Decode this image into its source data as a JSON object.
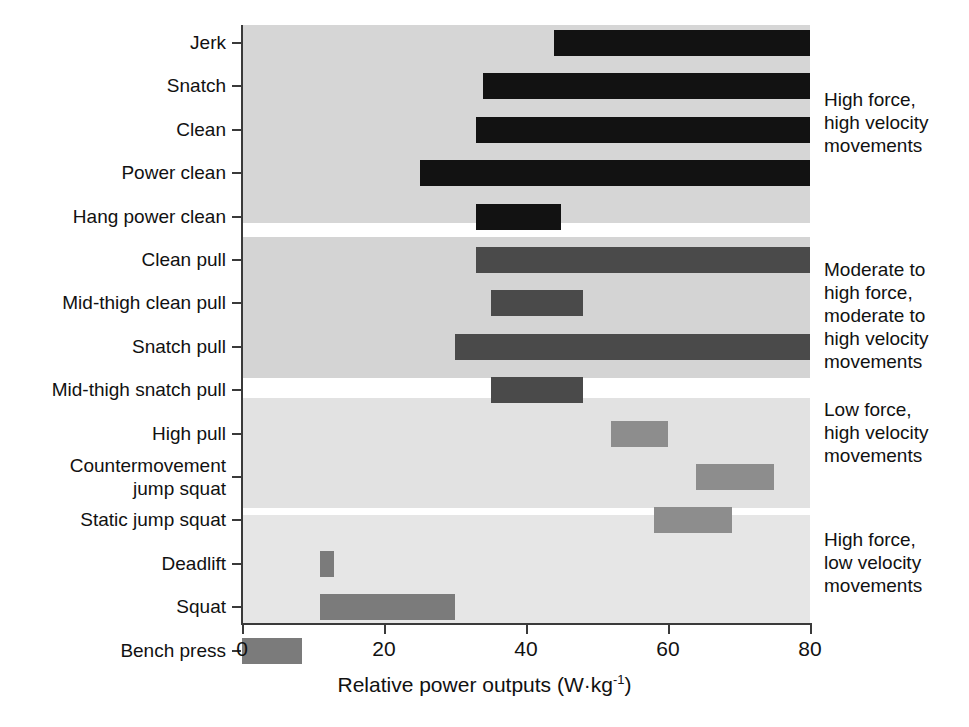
{
  "chart_data": {
    "type": "bar",
    "orientation": "horizontal",
    "title": "",
    "subtitle": "",
    "xlabel": "Relative power outputs (W·kg-1)",
    "xlabel_main": "Relative power outputs (W",
    "xlabel_middot": "·",
    "xlabel_kg": "kg",
    "xlabel_exp": "-1",
    "xlabel_close": ")",
    "ylabel": "",
    "xlim": [
      0,
      80
    ],
    "xticks": [
      0,
      20,
      40,
      60,
      80
    ],
    "xticklabels": [
      "0",
      "20",
      "40",
      "60",
      "80"
    ],
    "grid": false,
    "legend": "none",
    "value_units": "W·kg-1",
    "note": "Each bar is a floating range (start, end) of relative power output",
    "categories": [
      "Jerk",
      "Snatch",
      "Clean",
      "Power clean",
      "Hang power clean",
      "Clean pull",
      "Mid-thigh clean pull",
      "Snatch pull",
      "Mid-thigh snatch pull",
      "High pull",
      "Countermovement jump squat",
      "Static jump squat",
      "Deadlift",
      "Squat",
      "Bench press"
    ],
    "bars": [
      {
        "label": "Jerk",
        "start": 44,
        "end": 80,
        "group": 0,
        "color": "#121212"
      },
      {
        "label": "Snatch",
        "start": 34,
        "end": 80,
        "group": 0,
        "color": "#121212"
      },
      {
        "label": "Clean",
        "start": 33,
        "end": 80,
        "group": 0,
        "color": "#121212"
      },
      {
        "label": "Power clean",
        "start": 25,
        "end": 80,
        "group": 0,
        "color": "#121212"
      },
      {
        "label": "Hang power clean",
        "start": 33,
        "end": 45,
        "group": 0,
        "color": "#121212"
      },
      {
        "label": "Clean pull",
        "start": 33,
        "end": 80,
        "group": 1,
        "color": "#4a4a4a"
      },
      {
        "label": "Mid-thigh clean pull",
        "start": 35,
        "end": 48,
        "group": 1,
        "color": "#4a4a4a"
      },
      {
        "label": "Snatch pull",
        "start": 30,
        "end": 80,
        "group": 1,
        "color": "#4a4a4a"
      },
      {
        "label": "Mid-thigh snatch pull",
        "start": 35,
        "end": 48,
        "group": 1,
        "color": "#4a4a4a"
      },
      {
        "label": "High pull",
        "start": 52,
        "end": 60,
        "group": 2,
        "color": "#8d8d8d"
      },
      {
        "label": "Countermovement jump squat",
        "start": 64,
        "end": 75,
        "group": 2,
        "color": "#8d8d8d"
      },
      {
        "label": "Static jump squat",
        "start": 58,
        "end": 69,
        "group": 2,
        "color": "#8d8d8d"
      },
      {
        "label": "Deadlift",
        "start": 11,
        "end": 13,
        "group": 3,
        "color": "#7b7b7b"
      },
      {
        "label": "Squat",
        "start": 11,
        "end": 30,
        "group": 3,
        "color": "#7b7b7b"
      },
      {
        "label": "Bench press",
        "start": 0,
        "end": 8.5,
        "group": 3,
        "color": "#7b7b7b"
      }
    ],
    "groups": [
      {
        "name": "High force, high velocity movements",
        "annotation_lines": [
          "High force,",
          "high velocity",
          "movements"
        ],
        "band_color": "#d6d6d6"
      },
      {
        "name": "Moderate to high force, moderate to high velocity movements",
        "annotation_lines": [
          "Moderate to",
          "high force,",
          "moderate to",
          "high velocity",
          "movements"
        ],
        "band_color": "#d4d4d4"
      },
      {
        "name": "Low force, high velocity movements",
        "annotation_lines": [
          "Low force,",
          "high velocity",
          "movements"
        ],
        "band_color": "#e2e2e2"
      },
      {
        "name": "High force, low velocity movements",
        "annotation_lines": [
          "High force,",
          "low velocity",
          "movements"
        ],
        "band_color": "#e6e6e6"
      }
    ]
  },
  "ylabels": [
    {
      "text": "Jerk"
    },
    {
      "text": "Snatch"
    },
    {
      "text": "Clean"
    },
    {
      "text": "Power clean"
    },
    {
      "text": "Hang power clean"
    },
    {
      "text": "Clean pull"
    },
    {
      "text": "Mid-thigh clean pull"
    },
    {
      "text": "Snatch pull"
    },
    {
      "text": "Mid-thigh snatch pull"
    },
    {
      "text": "High pull"
    },
    {
      "text": "Countermovement jump squat"
    },
    {
      "text": "Static jump squat"
    },
    {
      "text": "Deadlift"
    },
    {
      "text": "Squat"
    },
    {
      "text": "Bench press"
    }
  ],
  "annotations": [
    {
      "line1": "High force,",
      "line2": "high velocity",
      "line3": "movements",
      "line4": "",
      "line5": ""
    },
    {
      "line1": "Moderate to",
      "line2": "high force,",
      "line3": "moderate to",
      "line4": "high velocity",
      "line5": "movements"
    },
    {
      "line1": "Low force,",
      "line2": "high velocity",
      "line3": "movements",
      "line4": "",
      "line5": ""
    },
    {
      "line1": "High force,",
      "line2": "low velocity",
      "line3": "movements",
      "line4": "",
      "line5": ""
    }
  ],
  "colors": {
    "bar_group1": "#121212",
    "bar_group2": "#4a4a4a",
    "bar_group3": "#8d8d8d",
    "bar_group4": "#7b7b7b",
    "band_group1": "#d6d6d6",
    "band_group2": "#d4d4d4",
    "band_group3": "#e2e2e2",
    "band_group4": "#e6e6e6",
    "axis": "#3a3a3a",
    "text": "#111111",
    "background": "#ffffff"
  }
}
